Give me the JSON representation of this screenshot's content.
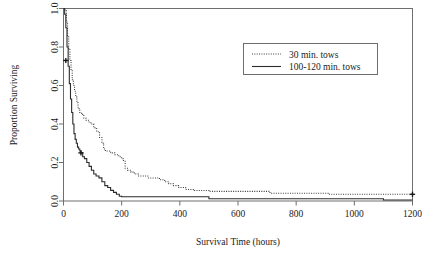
{
  "chart_data": {
    "type": "line",
    "subtype": "kaplan-meier-survival-step",
    "title": "",
    "xlabel": "Survival Time (hours)",
    "ylabel": "Proportion Surviving",
    "xlim": [
      0,
      1200
    ],
    "ylim": [
      0.0,
      1.0
    ],
    "xticks": [
      0,
      200,
      400,
      600,
      800,
      1000,
      1200
    ],
    "xtick_labels": [
      "0",
      "200",
      "400",
      "600",
      "800",
      "1000",
      "1200"
    ],
    "yticks": [
      0.0,
      0.2,
      0.4,
      0.6,
      0.8,
      1.0
    ],
    "ytick_labels": [
      "0.0",
      "0.2",
      "0.4",
      "0.6",
      "0.8",
      "1.0"
    ],
    "grid": false,
    "legend_position": "upper-right-inset",
    "step_direction": "post",
    "series": [
      {
        "name": "30 min. tows",
        "style": "dotted",
        "color": "#3a3a3a",
        "x": [
          0,
          5,
          10,
          14,
          18,
          22,
          26,
          30,
          34,
          38,
          42,
          46,
          50,
          56,
          62,
          70,
          78,
          86,
          94,
          104,
          114,
          124,
          132,
          138,
          144,
          150,
          162,
          176,
          190,
          200,
          206,
          212,
          220,
          232,
          244,
          258,
          272,
          290,
          310,
          330,
          348,
          362,
          378,
          396,
          420,
          450,
          500,
          560,
          620,
          690,
          710,
          760,
          830,
          890,
          910,
          980,
          1060,
          1140,
          1200
        ],
        "y": [
          1.0,
          0.99,
          0.93,
          0.86,
          0.79,
          0.73,
          0.68,
          0.63,
          0.6,
          0.57,
          0.54,
          0.51,
          0.48,
          0.46,
          0.45,
          0.43,
          0.42,
          0.41,
          0.4,
          0.38,
          0.36,
          0.33,
          0.3,
          0.27,
          0.26,
          0.26,
          0.25,
          0.24,
          0.23,
          0.22,
          0.21,
          0.17,
          0.16,
          0.15,
          0.14,
          0.13,
          0.13,
          0.12,
          0.12,
          0.11,
          0.1,
          0.09,
          0.08,
          0.07,
          0.06,
          0.055,
          0.05,
          0.05,
          0.05,
          0.05,
          0.04,
          0.04,
          0.04,
          0.04,
          0.035,
          0.035,
          0.035,
          0.035,
          0.035
        ]
      },
      {
        "name": "100-120 min. tows",
        "style": "solid",
        "color": "#2b2b2b",
        "x": [
          0,
          4,
          8,
          12,
          16,
          20,
          24,
          28,
          32,
          36,
          40,
          44,
          48,
          52,
          56,
          60,
          66,
          72,
          80,
          88,
          96,
          104,
          112,
          122,
          132,
          142,
          152,
          162,
          172,
          182,
          192,
          200,
          230,
          280,
          340,
          400,
          460,
          500,
          560,
          640,
          720,
          800,
          880,
          960,
          1040,
          1100,
          1160,
          1200
        ],
        "y": [
          1.0,
          0.97,
          0.9,
          0.8,
          0.7,
          0.61,
          0.53,
          0.46,
          0.4,
          0.35,
          0.32,
          0.3,
          0.28,
          0.27,
          0.26,
          0.25,
          0.23,
          0.22,
          0.2,
          0.18,
          0.16,
          0.14,
          0.13,
          0.12,
          0.1,
          0.08,
          0.07,
          0.055,
          0.045,
          0.035,
          0.025,
          0.022,
          0.022,
          0.022,
          0.022,
          0.022,
          0.022,
          0.012,
          0.012,
          0.012,
          0.012,
          0.012,
          0.012,
          0.012,
          0.012,
          0.005,
          0.005,
          0.005
        ]
      }
    ],
    "censored_marks": [
      {
        "series": "30 min. tows",
        "x": 8,
        "y": 0.73
      },
      {
        "series": "100-120 min. tows",
        "x": 60,
        "y": 0.25
      },
      {
        "series": "30 min. tows",
        "x": 1200,
        "y": 0.035
      }
    ],
    "annotations": []
  },
  "legend": {
    "entries": [
      {
        "label": "30 min. tows",
        "style": "dotted"
      },
      {
        "label": "100-120 min. tows",
        "style": "solid"
      }
    ]
  },
  "axes": {
    "x_title": "Survival Time (hours)",
    "y_title": "Proportion Surviving"
  },
  "colors": {
    "background": "#ffffff",
    "frame": "#6e6e6e",
    "series_dotted": "#3a3a3a",
    "series_solid": "#2b2b2b",
    "text": "#1a1a1a"
  }
}
